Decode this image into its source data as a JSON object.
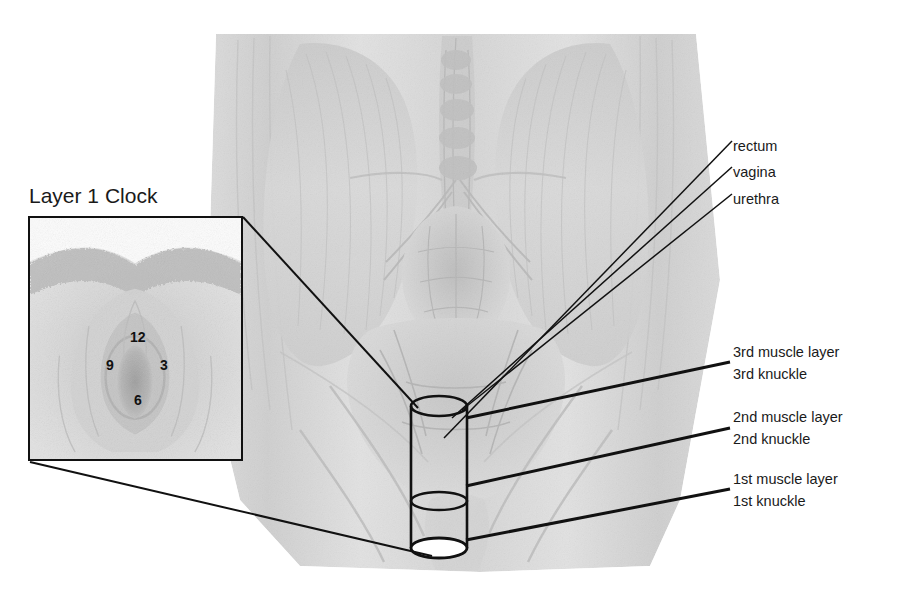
{
  "figure": {
    "background_color": "#ffffff",
    "line_color": "#111111",
    "text_color": "#1a1a1a"
  },
  "inset": {
    "title": "Layer 1 Clock",
    "clock_positions": [
      {
        "label": "12",
        "position": "top"
      },
      {
        "label": "3",
        "position": "right"
      },
      {
        "label": "6",
        "position": "bottom"
      },
      {
        "label": "9",
        "position": "left"
      }
    ]
  },
  "organ_labels": [
    {
      "text": "rectum"
    },
    {
      "text": "vagina"
    },
    {
      "text": "urethra"
    }
  ],
  "layer_labels": [
    {
      "muscle_layer": "3rd muscle layer",
      "knuckle": "3rd knuckle"
    },
    {
      "muscle_layer": "2nd muscle layer",
      "knuckle": "2nd knuckle"
    },
    {
      "muscle_layer": "1st muscle layer",
      "knuckle": "1st knuckle"
    }
  ],
  "cylinder": {
    "name": "vaginal-canal-cylinder",
    "segments": [
      "3rd layer",
      "2nd layer",
      "1st layer"
    ]
  }
}
